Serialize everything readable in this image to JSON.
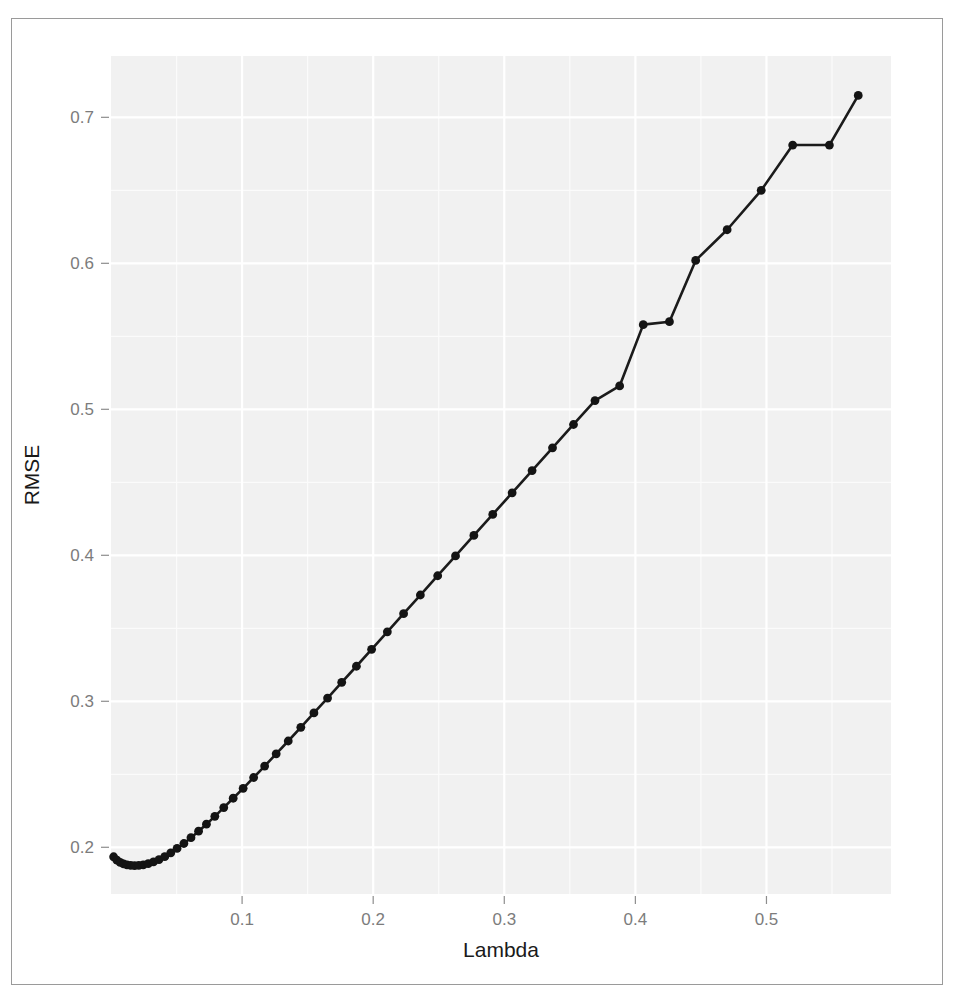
{
  "figure": {
    "frame_border_color": "#9a9a9a",
    "background_color": "#ffffff"
  },
  "chart_data": {
    "type": "line",
    "title": "",
    "subtitle": "",
    "xlabel": "Lambda",
    "ylabel": "RMSE",
    "xlim": [
      0.0,
      0.595
    ],
    "ylim": [
      0.168,
      0.742
    ],
    "xticks": [
      0.1,
      0.2,
      0.3,
      0.4,
      0.5
    ],
    "xtick_labels": [
      "0.1",
      "0.2",
      "0.3",
      "0.4",
      "0.5"
    ],
    "yticks": [
      0.2,
      0.3,
      0.4,
      0.5,
      0.6,
      0.7
    ],
    "ytick_labels": [
      "0.2",
      "0.3",
      "0.4",
      "0.5",
      "0.6",
      "0.7"
    ],
    "x_minor_ticks": [
      0.05,
      0.15,
      0.25,
      0.35,
      0.45,
      0.55
    ],
    "y_minor_ticks": [
      0.25,
      0.35,
      0.45,
      0.55,
      0.65
    ],
    "grid": true,
    "grid_color": "#ffffff",
    "panel_background": "#f1f1f1",
    "legend": null,
    "marker": "filled-circle",
    "marker_color": "#141414",
    "line_color": "#1b1b1b",
    "point_count": 60,
    "minimum_point": {
      "x": 0.026,
      "y": 0.1875
    },
    "series": [
      {
        "name": "RMSE",
        "x": [
          0.002,
          0.0045,
          0.007,
          0.0096,
          0.0122,
          0.015,
          0.018,
          0.0212,
          0.0246,
          0.0284,
          0.0324,
          0.0366,
          0.041,
          0.0456,
          0.0504,
          0.0556,
          0.061,
          0.0668,
          0.0728,
          0.0792,
          0.086,
          0.0932,
          0.1008,
          0.1088,
          0.1172,
          0.126,
          0.1352,
          0.1448,
          0.1548,
          0.1652,
          0.176,
          0.1872,
          0.1988,
          0.2108,
          0.2232,
          0.236,
          0.2492,
          0.2628,
          0.2768,
          0.2912,
          0.306,
          0.3212,
          0.3368,
          0.3528,
          0.3692,
          0.388,
          0.406,
          0.426,
          0.446,
          0.47,
          0.496,
          0.52,
          0.548,
          0.57
        ],
        "y": [
          0.1935,
          0.1912,
          0.1896,
          0.1886,
          0.1879,
          0.1876,
          0.1875,
          0.1876,
          0.188,
          0.1888,
          0.19,
          0.1916,
          0.1936,
          0.1962,
          0.1992,
          0.2026,
          0.2066,
          0.211,
          0.2158,
          0.2212,
          0.2272,
          0.2336,
          0.2404,
          0.2478,
          0.2556,
          0.264,
          0.2728,
          0.2822,
          0.292,
          0.3022,
          0.313,
          0.324,
          0.3356,
          0.3476,
          0.36,
          0.3728,
          0.386,
          0.3996,
          0.4136,
          0.428,
          0.4428,
          0.458,
          0.4736,
          0.4896,
          0.506,
          0.516,
          0.558,
          0.56,
          0.602,
          0.623,
          0.65,
          0.681,
          0.681,
          0.715
        ]
      }
    ],
    "annotations": []
  },
  "labels": {
    "x_axis_title": "Lambda",
    "y_axis_title": "RMSE"
  }
}
